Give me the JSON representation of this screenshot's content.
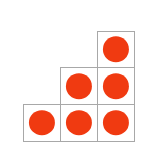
{
  "figure": {
    "background_color": "#ffffff",
    "cell_border_color": "#a8a8a8",
    "dot_color": "#f03a11",
    "columns": 3,
    "rows": 3,
    "total_dots": 6,
    "dots_per_row": [
      1,
      2,
      3
    ],
    "dots_per_column": [
      1,
      2,
      3
    ],
    "grid": [
      [
        {
          "filled": false,
          "dot": false
        },
        {
          "filled": false,
          "dot": false
        },
        {
          "filled": true,
          "dot": true
        }
      ],
      [
        {
          "filled": false,
          "dot": false
        },
        {
          "filled": true,
          "dot": true
        },
        {
          "filled": true,
          "dot": true
        }
      ],
      [
        {
          "filled": true,
          "dot": true
        },
        {
          "filled": true,
          "dot": true
        },
        {
          "filled": true,
          "dot": true
        }
      ]
    ]
  }
}
